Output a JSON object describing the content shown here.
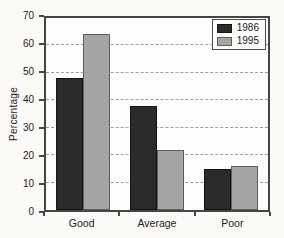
{
  "chart_data": {
    "type": "bar",
    "title": "",
    "xlabel": "",
    "ylabel": "Percentage",
    "categories": [
      "Good",
      "Average",
      "Poor"
    ],
    "series": [
      {
        "name": "1986",
        "color": "#2b2b2b",
        "border": "#141414",
        "values": [
          48,
          38,
          15
        ]
      },
      {
        "name": "1995",
        "color": "#a5a5a5",
        "border": "#5e5e5e",
        "values": [
          64,
          22,
          16
        ]
      }
    ],
    "ylim": [
      0,
      70
    ],
    "ytick_step": 10,
    "grid": "horizontal-dashed",
    "legend_position": "top-right",
    "colors": {
      "axis_border": "#454545",
      "gridline": "#9e9e9e",
      "background": "#fbfaf7",
      "plot_background": "#fdfdfb"
    }
  }
}
